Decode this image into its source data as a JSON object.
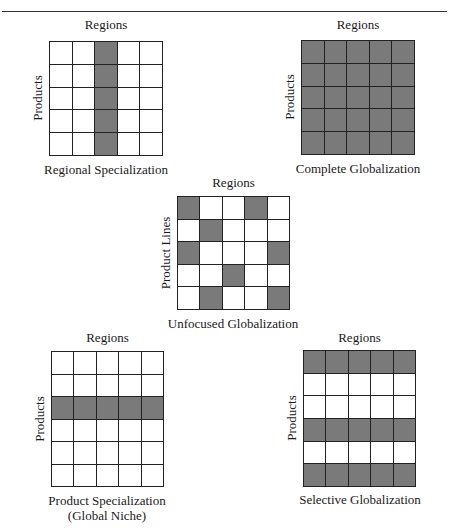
{
  "colors": {
    "filled": "#7a7a7a",
    "empty": "#ffffff",
    "gridline": "#222222"
  },
  "panels": [
    {
      "id": "regional-specialization",
      "top_label": "Regions",
      "side_label": "Products",
      "title": "Regional Specialization",
      "subtitle": "",
      "rows": 5,
      "cols": 5,
      "cells": [
        [
          0,
          0,
          1,
          0,
          0
        ],
        [
          0,
          0,
          1,
          0,
          0
        ],
        [
          0,
          0,
          1,
          0,
          0
        ],
        [
          0,
          0,
          1,
          0,
          0
        ],
        [
          0,
          0,
          1,
          0,
          0
        ]
      ]
    },
    {
      "id": "complete-globalization",
      "top_label": "Regions",
      "side_label": "Products",
      "title": "Complete Globalization",
      "subtitle": "",
      "rows": 5,
      "cols": 5,
      "cells": [
        [
          1,
          1,
          1,
          1,
          1
        ],
        [
          1,
          1,
          1,
          1,
          1
        ],
        [
          1,
          1,
          1,
          1,
          1
        ],
        [
          1,
          1,
          1,
          1,
          1
        ],
        [
          1,
          1,
          1,
          1,
          1
        ]
      ]
    },
    {
      "id": "unfocused-globalization",
      "top_label": "Regions",
      "side_label": "Product Lines",
      "title": "Unfocused Globalization",
      "subtitle": "",
      "rows": 5,
      "cols": 5,
      "cells": [
        [
          1,
          0,
          0,
          1,
          0
        ],
        [
          0,
          1,
          0,
          0,
          0
        ],
        [
          1,
          0,
          0,
          0,
          1
        ],
        [
          0,
          0,
          1,
          0,
          0
        ],
        [
          0,
          1,
          0,
          0,
          1
        ]
      ]
    },
    {
      "id": "product-specialization",
      "top_label": "Regions",
      "side_label": "Products",
      "title": "Product Specialization",
      "subtitle": "(Global Niche)",
      "rows": 6,
      "cols": 5,
      "cells": [
        [
          0,
          0,
          0,
          0,
          0
        ],
        [
          0,
          0,
          0,
          0,
          0
        ],
        [
          1,
          1,
          1,
          1,
          1
        ],
        [
          0,
          0,
          0,
          0,
          0
        ],
        [
          0,
          0,
          0,
          0,
          0
        ],
        [
          0,
          0,
          0,
          0,
          0
        ]
      ]
    },
    {
      "id": "selective-globalization",
      "top_label": "Regions",
      "side_label": "Products",
      "title": "Selective Globalization",
      "subtitle": "",
      "rows": 6,
      "cols": 5,
      "cells": [
        [
          1,
          1,
          1,
          1,
          1
        ],
        [
          0,
          0,
          0,
          0,
          0
        ],
        [
          0,
          0,
          0,
          0,
          0
        ],
        [
          1,
          1,
          1,
          1,
          1
        ],
        [
          0,
          0,
          0,
          0,
          0
        ],
        [
          1,
          1,
          1,
          1,
          1
        ]
      ]
    }
  ]
}
